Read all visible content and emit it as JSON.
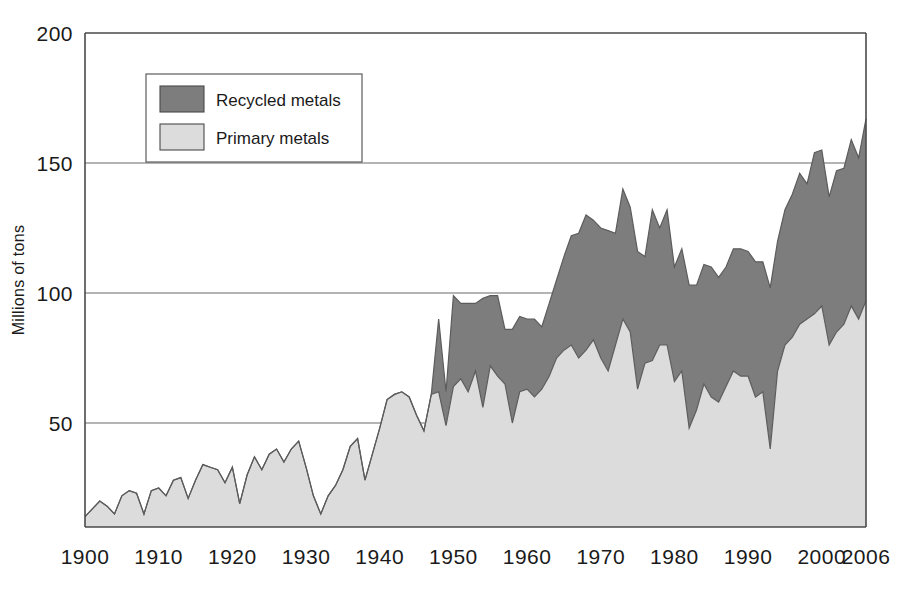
{
  "chart_data": {
    "type": "area",
    "stacked": true,
    "title": "",
    "xlabel": "",
    "ylabel": "Millions of tons",
    "xlim": [
      1900,
      2006
    ],
    "ylim": [
      0,
      200
    ],
    "y_ticks": [
      50,
      100,
      150,
      200
    ],
    "x_ticks": [
      1900,
      1910,
      1920,
      1930,
      1940,
      1950,
      1960,
      1970,
      1980,
      1990,
      2000,
      2006
    ],
    "x_tick_labels": [
      "1900",
      "1910",
      "1920",
      "1930",
      "1940",
      "1950",
      "1960",
      "1970",
      "1980",
      "1990",
      "2000",
      "2006"
    ],
    "y_tick_labels": [
      "50",
      "100",
      "150",
      "200"
    ],
    "grid": "horizontal",
    "legend_position": "top-left-inset",
    "baseline_value": 10,
    "colors": {
      "recycled": "#7d7d7d",
      "primary": "#dcdcdc",
      "outline": "#5c5c5c",
      "axis": "#4a4a4a",
      "grid": "#6b6b6b",
      "text": "#1a1a1a",
      "background": "#ffffff"
    },
    "legend": [
      {
        "label": "Recycled metals",
        "color": "#7d7d7d",
        "key": "recycled"
      },
      {
        "label": "Primary metals",
        "color": "#dcdcdc",
        "key": "primary"
      }
    ],
    "x": [
      1900,
      1901,
      1902,
      1903,
      1904,
      1905,
      1906,
      1907,
      1908,
      1909,
      1910,
      1911,
      1912,
      1913,
      1914,
      1915,
      1916,
      1917,
      1918,
      1919,
      1920,
      1921,
      1922,
      1923,
      1924,
      1925,
      1926,
      1927,
      1928,
      1929,
      1930,
      1931,
      1932,
      1933,
      1934,
      1935,
      1936,
      1937,
      1938,
      1939,
      1940,
      1941,
      1942,
      1943,
      1944,
      1945,
      1946,
      1947,
      1948,
      1949,
      1950,
      1951,
      1952,
      1953,
      1954,
      1955,
      1956,
      1957,
      1958,
      1959,
      1960,
      1961,
      1962,
      1963,
      1964,
      1965,
      1966,
      1967,
      1968,
      1969,
      1970,
      1971,
      1972,
      1973,
      1974,
      1975,
      1976,
      1977,
      1978,
      1979,
      1980,
      1981,
      1982,
      1983,
      1984,
      1985,
      1986,
      1987,
      1988,
      1989,
      1990,
      1991,
      1992,
      1993,
      1994,
      1995,
      1996,
      1997,
      1998,
      1999,
      2000,
      2001,
      2002,
      2003,
      2004,
      2005,
      2006
    ],
    "series": [
      {
        "name": "Primary metals",
        "key": "primary",
        "color": "#dcdcdc",
        "values": [
          14,
          17,
          20,
          18,
          15,
          22,
          24,
          23,
          15,
          24,
          25,
          22,
          28,
          29,
          21,
          28,
          34,
          33,
          32,
          27,
          33,
          19,
          30,
          37,
          32,
          38,
          40,
          35,
          40,
          43,
          33,
          22,
          15,
          22,
          26,
          32,
          41,
          44,
          28,
          38,
          48,
          59,
          61,
          62,
          60,
          53,
          47,
          61,
          62,
          49,
          64,
          67,
          62,
          70,
          56,
          72,
          68,
          65,
          50,
          62,
          63,
          60,
          63,
          68,
          75,
          78,
          80,
          75,
          78,
          82,
          75,
          70,
          80,
          90,
          85,
          63,
          73,
          74,
          80,
          80,
          66,
          70,
          48,
          55,
          65,
          60,
          58,
          64,
          70,
          68,
          68,
          60,
          62,
          40,
          70,
          80,
          83,
          88,
          90,
          92,
          95,
          80,
          85,
          88,
          95,
          90,
          97
        ]
      },
      {
        "name": "Recycled metals",
        "key": "recycled",
        "color": "#7d7d7d",
        "values": [
          0,
          0,
          0,
          0,
          0,
          0,
          0,
          0,
          0,
          0,
          0,
          0,
          0,
          0,
          0,
          0,
          0,
          0,
          0,
          0,
          0,
          0,
          0,
          0,
          0,
          0,
          0,
          0,
          0,
          0,
          0,
          0,
          0,
          0,
          0,
          0,
          0,
          0,
          0,
          0,
          0,
          0,
          0,
          0,
          0,
          0,
          0,
          0,
          28,
          13,
          35,
          29,
          34,
          26,
          42,
          27,
          31,
          21,
          36,
          29,
          27,
          30,
          24,
          28,
          30,
          36,
          42,
          48,
          52,
          46,
          50,
          54,
          43,
          50,
          48,
          53,
          41,
          58,
          45,
          52,
          44,
          47,
          55,
          48,
          46,
          50,
          48,
          46,
          47,
          49,
          48,
          52,
          50,
          62,
          50,
          52,
          55,
          58,
          52,
          62,
          60,
          57,
          62,
          60,
          64,
          62,
          70
        ]
      }
    ]
  },
  "axis": {
    "y_title": "Millions of tons"
  },
  "legend": {
    "items": [
      {
        "label": "Recycled metals"
      },
      {
        "label": "Primary metals"
      }
    ]
  }
}
